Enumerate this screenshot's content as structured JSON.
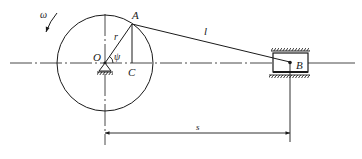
{
  "diagram": {
    "type": "crank-slider mechanism",
    "colors": {
      "line": "#1a1a1a",
      "background": "#ffffff"
    },
    "labels": {
      "omega": "ω",
      "A": "A",
      "O": "O",
      "C": "C",
      "r": "r",
      "psi": "ψ",
      "l": "l",
      "B": "B",
      "s": "s"
    },
    "elements": {
      "crank_circle": {
        "center": [
          105,
          63
        ],
        "radius": 48
      },
      "crank_arm": {
        "from": "O",
        "to": "A"
      },
      "connecting_rod": {
        "from": "A",
        "to": "B"
      },
      "slider": {
        "label": "B"
      },
      "dimension": {
        "label": "s",
        "from": "O",
        "to": "B"
      }
    }
  }
}
